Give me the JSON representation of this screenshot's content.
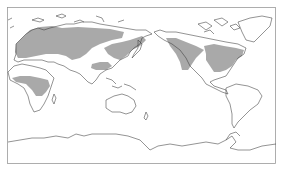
{
  "map": {
    "projection": "pacific-centered equirectangular",
    "colors": {
      "background": "#ffffff",
      "frame": "#9a9a9a",
      "coastline": "#3a3a3a",
      "shaded_region": "#a9a9a9"
    },
    "shaded_regions": [
      "europe-northern-asia",
      "east-asia",
      "central-asia-south",
      "central-africa",
      "western-north-america",
      "eastern-north-america"
    ]
  }
}
